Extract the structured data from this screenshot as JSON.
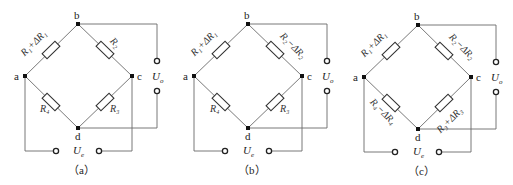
{
  "figure": {
    "panels": [
      {
        "caption": "（a）",
        "nodes": {
          "a": "a",
          "b": "b",
          "c": "c",
          "d": "d"
        },
        "resistors": {
          "ab": "R₁+ΔR₁",
          "bc": "R₂",
          "cd": "R₃",
          "da": "R₄"
        },
        "output_label": "U",
        "output_sub": "o",
        "supply_label": "U",
        "supply_sub": "e"
      },
      {
        "caption": "（b）",
        "nodes": {
          "a": "a",
          "b": "b",
          "c": "c",
          "d": "d"
        },
        "resistors": {
          "ab": "R₁+ΔR₁",
          "bc": "R₂−ΔR₂",
          "cd": "R₃",
          "da": "R₄"
        },
        "output_label": "U",
        "output_sub": "o",
        "supply_label": "U",
        "supply_sub": "e"
      },
      {
        "caption": "（c）",
        "nodes": {
          "a": "a",
          "b": "b",
          "c": "c",
          "d": "d"
        },
        "resistors": {
          "ab": "R₁+ΔR₁",
          "bc": "R₂−ΔR₂",
          "cd": "R₃+ΔR₃",
          "da": "R₄−ΔR₄"
        },
        "output_label": "U",
        "output_sub": "o",
        "supply_label": "U",
        "supply_sub": "e"
      }
    ]
  }
}
